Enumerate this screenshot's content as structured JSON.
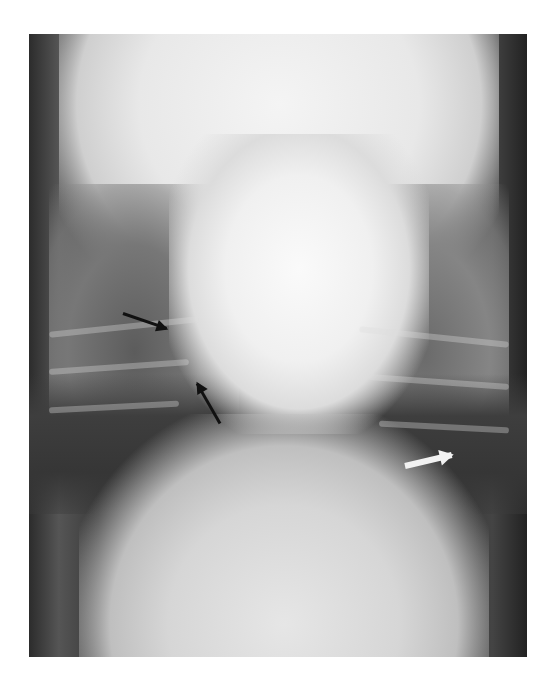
{
  "image": {
    "description": "Radiograph (X-ray) of a thorax, ventrodorsal view",
    "annotations": [
      {
        "type": "arrow",
        "color": "black",
        "from": [
          123,
          313
        ],
        "to": [
          167,
          328
        ]
      },
      {
        "type": "arrow",
        "color": "black",
        "from": [
          220,
          423
        ],
        "to": [
          197,
          383
        ]
      },
      {
        "type": "arrow",
        "color": "white",
        "from": [
          405,
          466
        ],
        "to": [
          452,
          455
        ]
      }
    ],
    "colors": {
      "background": "#ffffff",
      "film_dark": "#3a3a3a",
      "bone_bright": "#f4f4f4"
    }
  }
}
